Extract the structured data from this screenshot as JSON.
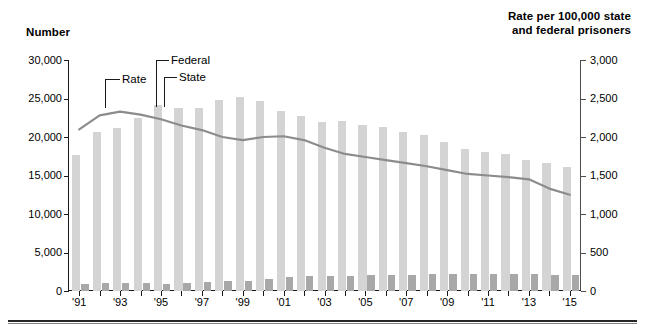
{
  "chart_data": {
    "type": "bar",
    "title": "",
    "xlabel": "",
    "ylabel": "Number",
    "y2label": "Rate per 100,000 state\nand federal prisoners",
    "grid": false,
    "legend": "annotations-with-leader-lines",
    "ylim": [
      0,
      30000
    ],
    "y2lim": [
      0,
      3000
    ],
    "yticks": [
      "0",
      "5,000",
      "10,000",
      "15,000",
      "20,000",
      "25,000",
      "30,000"
    ],
    "ytick_values": [
      0,
      5000,
      10000,
      15000,
      20000,
      25000,
      30000
    ],
    "y2ticks": [
      "0",
      "500",
      "1,000",
      "1,500",
      "2,000",
      "2,500",
      "3,000"
    ],
    "y2tick_values": [
      0,
      500,
      1000,
      1500,
      2000,
      2500,
      3000
    ],
    "categories": [
      "'91",
      "'92",
      "'93",
      "'94",
      "'95",
      "'96",
      "'97",
      "'98",
      "'99",
      "'00",
      "'01",
      "'02",
      "'03",
      "'04",
      "'05",
      "'06",
      "'07",
      "'08",
      "'09",
      "'10",
      "'11",
      "'12",
      "'13",
      "'14",
      "'15"
    ],
    "xtick_labels_shown": [
      "'91",
      "'93",
      "'95",
      "'97",
      "'99",
      "'01",
      "'03",
      "'05",
      "'07",
      "'09",
      "'11",
      "'13",
      "'15"
    ],
    "series": [
      {
        "name": "State",
        "axis": "left",
        "color": "#d4d4d4",
        "values": [
          17600,
          20600,
          21200,
          22500,
          24100,
          23800,
          23800,
          24800,
          25200,
          24700,
          23400,
          22700,
          22000,
          22100,
          21600,
          21300,
          20700,
          20200,
          19300,
          18500,
          18000,
          17800,
          17000,
          16600,
          16100
        ]
      },
      {
        "name": "Federal",
        "axis": "left",
        "color": "#a8a8a8",
        "values": [
          850,
          1050,
          1100,
          1050,
          950,
          1050,
          1150,
          1300,
          1300,
          1550,
          1800,
          1900,
          2000,
          2000,
          2050,
          2100,
          2100,
          2150,
          2200,
          2200,
          2200,
          2150,
          2150,
          2050,
          2050
        ]
      },
      {
        "name": "Rate",
        "axis": "right",
        "color": "#8c8c8c",
        "type": "line",
        "values": [
          2100,
          2280,
          2330,
          2290,
          2230,
          2150,
          2090,
          2000,
          1960,
          2000,
          2010,
          1960,
          1860,
          1780,
          1740,
          1700,
          1660,
          1620,
          1570,
          1520,
          1500,
          1480,
          1450,
          1330,
          1250
        ]
      }
    ],
    "annotations": [
      {
        "label": "Rate",
        "target_series": "Rate"
      },
      {
        "label": "Federal",
        "target_series": "Federal"
      },
      {
        "label": "State",
        "target_series": "State"
      }
    ]
  }
}
